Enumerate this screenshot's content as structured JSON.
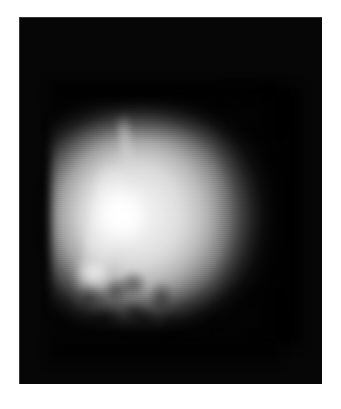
{
  "figure": {
    "kind": "grayscale-astronomical-image",
    "caption": "",
    "canvas": {
      "width_px": 341,
      "height_px": 409,
      "background_color": "#ffffff"
    },
    "plate": {
      "label": "image-plate",
      "left_px": 19,
      "top_px": 17,
      "width_px": 303,
      "height_px": 367,
      "background_color": "#050505",
      "border_color": "#969696"
    },
    "subject": {
      "name": "planetary-disk",
      "center_x_px": 160,
      "center_y_px": 215,
      "radius_px": 105,
      "limb_softness": "diffuse",
      "peak_brightness_hex": "#ffffff",
      "background_hex": "#050505"
    },
    "features": [
      {
        "name": "bright-core",
        "description": "saturated near-white region on the left-central limb",
        "center_x_px": 104,
        "center_y_px": 200,
        "brightness_hex": "#ffffff"
      },
      {
        "name": "bright-knot",
        "description": "secondary bright patch below and left of the core",
        "center_x_px": 94,
        "center_y_px": 273,
        "brightness_hex": "#fafafa"
      },
      {
        "name": "diagonal-streak",
        "description": "terminator-like bright streak running upper-left to lower-right",
        "start_x_px": 103,
        "start_y_px": 167,
        "end_x_px": 136,
        "end_y_px": 300,
        "brightness_hex": "#fcfcfc"
      },
      {
        "name": "top-streak",
        "description": "faint vertical bright filament near the top of the disk",
        "center_x_px": 125,
        "center_y_px": 140,
        "brightness_hex": "#eeeeee"
      },
      {
        "name": "dark-mottling",
        "description": "mottled cratered dark terrain across the lower-left quadrant",
        "center_x_px": 120,
        "center_y_px": 290,
        "brightness_hex": "#3a3a3a"
      },
      {
        "name": "smooth-limb-falloff",
        "description": "smooth brightness gradient fading to black at the right and top limbs",
        "center_x_px": 235,
        "center_y_px": 200,
        "brightness_hex": "#1a1a1a"
      }
    ]
  }
}
